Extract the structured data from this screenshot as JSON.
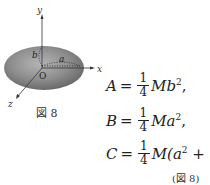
{
  "figure": {
    "axes": {
      "x": "x",
      "y": "y",
      "z": "z",
      "origin": "O"
    },
    "semi_axes": {
      "a": "a",
      "b": "b"
    },
    "caption": "図 8",
    "fill_color": "#8c8c8c"
  },
  "equations": [
    {
      "lhs": "A",
      "op": "=",
      "num": "1",
      "den": "4",
      "rest_prefix": "M",
      "rest_main": "b",
      "rest_sup": "2",
      "rest_suffix": ","
    },
    {
      "lhs": "B",
      "op": "=",
      "num": "1",
      "den": "4",
      "rest_prefix": "M",
      "rest_main": "a",
      "rest_sup": "2",
      "rest_suffix": ","
    },
    {
      "lhs": "C",
      "op": "=",
      "num": "1",
      "den": "4",
      "rest_prefix": "M(a",
      "rest_main": "",
      "rest_sup": "2",
      "rest_suffix": " + b² )"
    }
  ],
  "reference": "(図 8)"
}
